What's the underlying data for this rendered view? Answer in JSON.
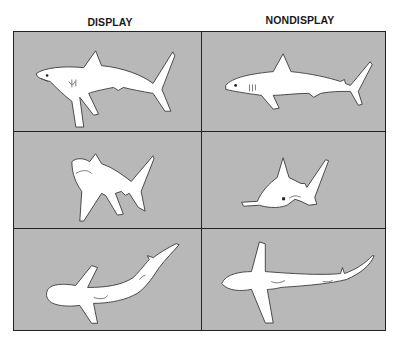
{
  "figure": {
    "columns": [
      {
        "label": "DISPLAY"
      },
      {
        "label": "NONDISPLAY"
      }
    ],
    "panels": [
      {
        "row": 1,
        "column": "DISPLAY",
        "view": "lateral",
        "description": "shark with arched back, head raised, pectoral fins lowered"
      },
      {
        "row": 1,
        "column": "NONDISPLAY",
        "view": "lateral",
        "description": "shark swimming normally, straight body"
      },
      {
        "row": 2,
        "column": "DISPLAY",
        "view": "frontal-oblique",
        "description": "shark with pectoral fins depressed, snout raised"
      },
      {
        "row": 2,
        "column": "NONDISPLAY",
        "view": "frontal-oblique",
        "description": "shark swimming normally, fins horizontal"
      },
      {
        "row": 3,
        "column": "DISPLAY",
        "view": "dorsal",
        "description": "shark with body bent, pectoral fins lowered"
      },
      {
        "row": 3,
        "column": "NONDISPLAY",
        "view": "dorsal",
        "description": "shark swimming normally, pectoral fins spread"
      }
    ],
    "colors": {
      "panel_background": "#b8b8b8",
      "shark_fill": "#ffffff",
      "border": "#222222"
    }
  }
}
